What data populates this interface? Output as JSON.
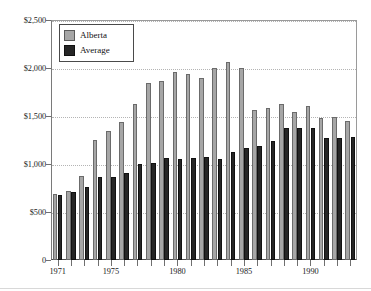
{
  "chart_data": {
    "type": "bar",
    "title": "",
    "subtitle": "",
    "xlabel": "",
    "ylabel": "",
    "ylim": [
      0,
      2500
    ],
    "ytick_values": [
      0,
      500,
      1000,
      1500,
      2000,
      2500
    ],
    "ytick_labels": [
      "0",
      "$500",
      "$1,000",
      "$1,500",
      "$2,000",
      "$2,500"
    ],
    "grid": true,
    "grid_axis": "y",
    "legend_position": "top-left",
    "categories": [
      "1971",
      "1972",
      "1973",
      "1974",
      "1975",
      "1976",
      "1977",
      "1978",
      "1979",
      "1980",
      "1981",
      "1982",
      "1983",
      "1984",
      "1985",
      "1986",
      "1987",
      "1988",
      "1989",
      "1990",
      "1991",
      "1992",
      "1993"
    ],
    "xtick_labels_shown": [
      "1971",
      "1975",
      "1980",
      "1985",
      "1990"
    ],
    "xtick_label_categories": [
      "1971",
      "1975",
      "1980",
      "1985",
      "1990"
    ],
    "series": [
      {
        "name": "Alberta",
        "color": "#a6a6a6",
        "values": [
          690,
          720,
          875,
          1250,
          1340,
          1440,
          1625,
          1840,
          1860,
          1960,
          1940,
          1900,
          2000,
          2060,
          2000,
          1560,
          1585,
          1630,
          1545,
          1605,
          1475,
          1485,
          1450
        ]
      },
      {
        "name": "Average",
        "color": "#262626",
        "values": [
          680,
          705,
          760,
          860,
          860,
          910,
          995,
          1015,
          1065,
          1055,
          1065,
          1070,
          1055,
          1120,
          1170,
          1185,
          1235,
          1375,
          1375,
          1380,
          1270,
          1270,
          1280
        ]
      }
    ]
  },
  "legend": {
    "items": [
      {
        "label": "Alberta",
        "swatch": "alberta"
      },
      {
        "label": "Average",
        "swatch": "average"
      }
    ]
  }
}
